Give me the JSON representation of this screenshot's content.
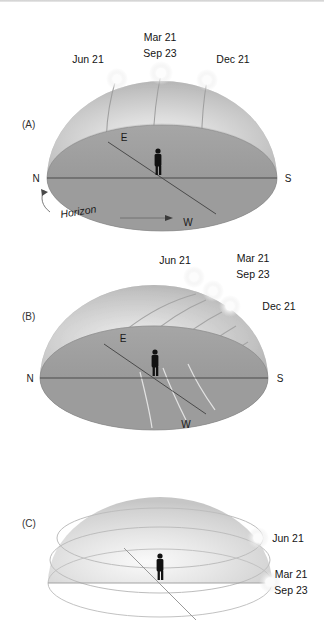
{
  "figure": {
    "background_color": "#ffffff",
    "dome_color": "#c9c9c9",
    "dome_highlight": "#ececec",
    "ground_color": "#9a9a9a",
    "sun_color": "#fdfdfd",
    "text_color": "#1a1a1a"
  },
  "panels": [
    {
      "id": "A",
      "label": "(A)",
      "description": "Observer at mid-northern latitude; sun paths arc steeply and tilt toward the south",
      "suns": [
        {
          "name": "jun-21",
          "label": "Jun 21"
        },
        {
          "name": "mar-sep",
          "label_line1": "Mar 21",
          "label_line2": "Sep 23"
        },
        {
          "name": "dec-21",
          "label": "Dec 21"
        }
      ],
      "compass": {
        "north": "N",
        "east": "E",
        "south": "S",
        "west": "W"
      },
      "horizon_label": "Horizon"
    },
    {
      "id": "B",
      "label": "(B)",
      "description": "Observer at the equator; sun paths are steeply inclined and cross the horizon vertically",
      "suns": [
        {
          "name": "jun-21",
          "label": "Jun 21"
        },
        {
          "name": "mar-sep",
          "label_line1": "Mar 21",
          "label_line2": "Sep 23"
        },
        {
          "name": "dec-21",
          "label": "Dec 21"
        }
      ],
      "compass": {
        "north": "N",
        "east": "E",
        "south": "S",
        "west": "W"
      },
      "horizon_label": ""
    },
    {
      "id": "C",
      "label": "(C)",
      "description": "Observer at the North Pole; sun paths are circles parallel to the horizon",
      "suns": [
        {
          "name": "jun-21",
          "label": "Jun 21"
        },
        {
          "name": "mar-sep",
          "label_line1": "Mar 21",
          "label_line2": "Sep 23"
        }
      ],
      "compass": {
        "north": "",
        "east": "",
        "south": "",
        "west": ""
      },
      "horizon_label": ""
    }
  ]
}
